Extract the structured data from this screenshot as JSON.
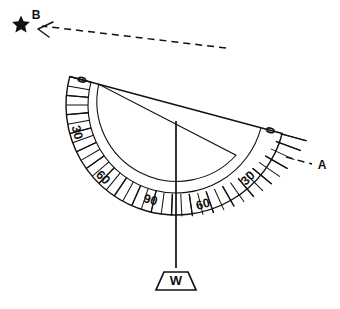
{
  "figure": {
    "background_color": "#ffffff",
    "ink_color": "#111111"
  },
  "protractor": {
    "name": "semicircular-protractor",
    "tilt_degrees": 15,
    "center": {
      "x": 176,
      "y": 105
    },
    "outer_radius": 110,
    "inner_radius": 88,
    "scale_min": 0,
    "scale_max": 90,
    "tick_interval_minor": 5,
    "tick_interval_major": 10,
    "label_interval": 30
  },
  "scale_labels": {
    "left_side": [
      {
        "value": "0",
        "angle": 0
      },
      {
        "value": "30",
        "angle": 30
      },
      {
        "value": "60",
        "angle": 60
      },
      {
        "value": "90",
        "angle": 90
      }
    ],
    "right_side": [
      {
        "value": "0",
        "angle": 0
      },
      {
        "value": "30",
        "angle": 30
      },
      {
        "value": "60",
        "angle": 60
      },
      {
        "value": "90",
        "angle": 90
      }
    ]
  },
  "markers": {
    "star": {
      "label": "star-marker",
      "glyph": "★"
    },
    "point_b": {
      "label": "B"
    },
    "point_a": {
      "label": "A"
    },
    "weight": {
      "label": "W"
    }
  },
  "lines": {
    "sight_line": {
      "name": "sight-line-to-star",
      "style": "dashed",
      "arrow": true
    },
    "plumb_line": {
      "name": "plumb-line",
      "style": "solid",
      "reading_value": "60"
    }
  }
}
